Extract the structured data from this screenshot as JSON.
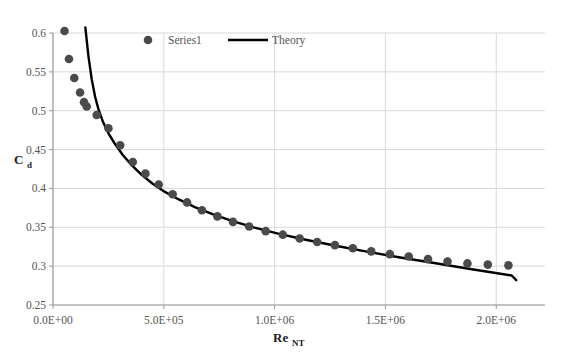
{
  "chart_data": {
    "type": "scatter",
    "title": "",
    "xlabel": "Re_NT",
    "xlabel_base": "Re",
    "xlabel_sub": "NT",
    "ylabel": "Cd",
    "ylabel_base": "C",
    "ylabel_sub": "d",
    "xlim": [
      0,
      2220000
    ],
    "ylim": [
      0.25,
      0.6
    ],
    "xticks": [
      0,
      500000,
      1000000,
      1500000,
      2000000
    ],
    "xticklabels": [
      "0.0E+00",
      "5.0E+05",
      "1.0E+06",
      "1.5E+06",
      "2.0E+06"
    ],
    "yticks": [
      0.25,
      0.3,
      0.35,
      0.4,
      0.45,
      0.5,
      0.55,
      0.6
    ],
    "yticklabels": [
      "0.25",
      "0.3",
      "0.35",
      "0.4",
      "0.45",
      "0.5",
      "0.55",
      "0.6"
    ],
    "grid": true,
    "grid_color": "#d9d9d9",
    "legend_position": "top-center-inside",
    "series": [
      {
        "name": "Series1",
        "type": "scatter",
        "marker": "circle",
        "color": "#4a4a4a",
        "points": [
          {
            "x": 52000,
            "y": 0.6025
          },
          {
            "x": 72000,
            "y": 0.5665
          },
          {
            "x": 96000,
            "y": 0.542
          },
          {
            "x": 122000,
            "y": 0.5235
          },
          {
            "x": 140000,
            "y": 0.511
          },
          {
            "x": 152000,
            "y": 0.5055
          },
          {
            "x": 197000,
            "y": 0.4945
          },
          {
            "x": 250000,
            "y": 0.4775
          },
          {
            "x": 303000,
            "y": 0.4555
          },
          {
            "x": 360000,
            "y": 0.434
          },
          {
            "x": 417000,
            "y": 0.419
          },
          {
            "x": 477000,
            "y": 0.405
          },
          {
            "x": 540000,
            "y": 0.3925
          },
          {
            "x": 605000,
            "y": 0.382
          },
          {
            "x": 672000,
            "y": 0.372
          },
          {
            "x": 742000,
            "y": 0.364
          },
          {
            "x": 812000,
            "y": 0.357
          },
          {
            "x": 885000,
            "y": 0.351
          },
          {
            "x": 960000,
            "y": 0.345
          },
          {
            "x": 1037000,
            "y": 0.3405
          },
          {
            "x": 1113000,
            "y": 0.3355
          },
          {
            "x": 1192000,
            "y": 0.331
          },
          {
            "x": 1272000,
            "y": 0.327
          },
          {
            "x": 1353000,
            "y": 0.323
          },
          {
            "x": 1436000,
            "y": 0.319
          },
          {
            "x": 1520000,
            "y": 0.3155
          },
          {
            "x": 1605000,
            "y": 0.3125
          },
          {
            "x": 1692000,
            "y": 0.309
          },
          {
            "x": 1780000,
            "y": 0.306
          },
          {
            "x": 1870000,
            "y": 0.3035
          },
          {
            "x": 1962000,
            "y": 0.302
          },
          {
            "x": 2055000,
            "y": 0.301
          }
        ]
      },
      {
        "name": "Theory",
        "type": "line",
        "color": "#000000",
        "linewidth": 2.4,
        "points": [
          {
            "x": 146000,
            "y": 0.607
          },
          {
            "x": 160000,
            "y": 0.57
          },
          {
            "x": 175000,
            "y": 0.54
          },
          {
            "x": 190000,
            "y": 0.518
          },
          {
            "x": 205000,
            "y": 0.502
          },
          {
            "x": 225000,
            "y": 0.486
          },
          {
            "x": 250000,
            "y": 0.471
          },
          {
            "x": 280000,
            "y": 0.457
          },
          {
            "x": 315000,
            "y": 0.443
          },
          {
            "x": 355000,
            "y": 0.43
          },
          {
            "x": 400000,
            "y": 0.4175
          },
          {
            "x": 450000,
            "y": 0.406
          },
          {
            "x": 505000,
            "y": 0.3955
          },
          {
            "x": 570000,
            "y": 0.3855
          },
          {
            "x": 640000,
            "y": 0.376
          },
          {
            "x": 720000,
            "y": 0.367
          },
          {
            "x": 810000,
            "y": 0.358
          },
          {
            "x": 910000,
            "y": 0.3495
          },
          {
            "x": 1020000,
            "y": 0.3415
          },
          {
            "x": 1140000,
            "y": 0.334
          },
          {
            "x": 1270000,
            "y": 0.3265
          },
          {
            "x": 1410000,
            "y": 0.319
          },
          {
            "x": 1560000,
            "y": 0.3115
          },
          {
            "x": 1720000,
            "y": 0.304
          },
          {
            "x": 1890000,
            "y": 0.296
          },
          {
            "x": 2070000,
            "y": 0.288
          },
          {
            "x": 2090000,
            "y": 0.282
          }
        ]
      }
    ]
  },
  "legend": {
    "items": [
      {
        "label": "Series1",
        "marker": "circle",
        "color": "#4a4a4a"
      },
      {
        "label": "Theory",
        "marker": "line",
        "color": "#000000"
      }
    ]
  },
  "artifacts": {
    "top_text": "",
    "bottom_text": ""
  }
}
